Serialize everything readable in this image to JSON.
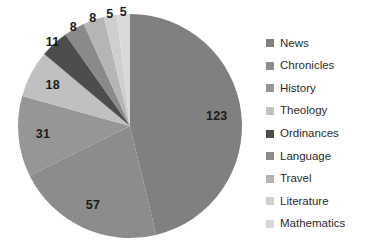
{
  "chart_data": {
    "type": "pie",
    "title": "",
    "categories": [
      "News",
      "Chronicles",
      "History",
      "Theology",
      "Ordinances",
      "Language",
      "Travel",
      "Literature",
      "Mathematics"
    ],
    "values": [
      123,
      57,
      31,
      18,
      11,
      8,
      8,
      5,
      5
    ],
    "labels": [
      "123",
      "57",
      "31",
      "18",
      "11",
      "8",
      "8",
      "5",
      "5"
    ],
    "total": 266,
    "colors": [
      "#808080",
      "#8c8c8c",
      "#969696",
      "#c0c0c0",
      "#4d4d4d",
      "#8a8a8a",
      "#b5b5b5",
      "#cfcfcf",
      "#d9d9d9"
    ],
    "start_angle": 0,
    "direction": "clockwise",
    "legend_position": "right",
    "grid": false,
    "xlabel": "",
    "ylabel": ""
  },
  "legend": {
    "items": [
      {
        "label": "News",
        "color": "#808080"
      },
      {
        "label": "Chronicles",
        "color": "#8c8c8c"
      },
      {
        "label": "History",
        "color": "#969696"
      },
      {
        "label": "Theology",
        "color": "#c0c0c0"
      },
      {
        "label": "Ordinances",
        "color": "#4d4d4d"
      },
      {
        "label": "Language",
        "color": "#8a8a8a"
      },
      {
        "label": "Travel",
        "color": "#b5b5b5"
      },
      {
        "label": "Literature",
        "color": "#cfcfcf"
      },
      {
        "label": "Mathematics",
        "color": "#d9d9d9"
      }
    ]
  },
  "geometry": {
    "center_x": 130,
    "center_y": 126,
    "radius": 112,
    "label_radius_factor": 0.78
  }
}
